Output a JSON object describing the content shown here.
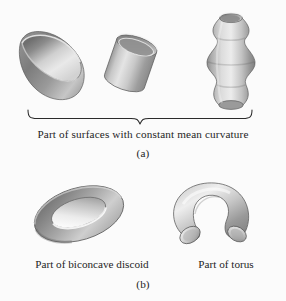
{
  "figure": {
    "background_color": "#fbfbfb",
    "ink_color": "#1e1e1e",
    "panels": [
      {
        "id": "a",
        "label": "(a)",
        "group_caption": "Part of surfaces with constant mean curvature",
        "shapes": [
          {
            "name": "hemisphere",
            "label": ""
          },
          {
            "name": "cylinder",
            "label": ""
          },
          {
            "name": "unduloid",
            "label": ""
          }
        ]
      },
      {
        "id": "b",
        "label": "(b)",
        "shapes": [
          {
            "name": "biconcave-discoid",
            "label": "Part of biconcave discoid"
          },
          {
            "name": "torus",
            "label": "Part of torus"
          }
        ]
      }
    ]
  },
  "captions": {
    "panel_a_group": "Part of surfaces with constant mean curvature",
    "panel_a_label": "(a)",
    "biconcave_discoid": "Part of biconcave discoid",
    "torus": "Part of torus",
    "panel_b_label": "(b)"
  },
  "colors": {
    "surface_light": "#ededed",
    "surface_mid": "#b9b9b9",
    "surface_dark": "#7e7e7e",
    "surface_darkest": "#6a6a6a",
    "outline": "#4a4a4a",
    "paper": "#fbfbfb",
    "text": "#1e1e1e"
  }
}
